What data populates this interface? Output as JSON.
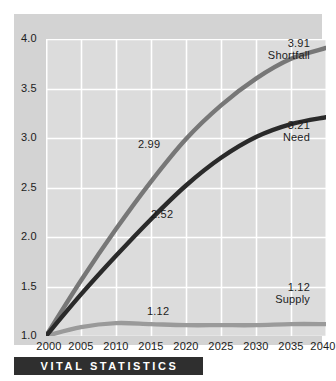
{
  "banner": {
    "title": "VITAL STATISTICS",
    "background": "#2f2f2f",
    "text_color": "#ffffff"
  },
  "colors": {
    "outer_panel": "#d3d3d3",
    "plot_background": "#dcdcdc",
    "gridline": "#ffffff",
    "shortfall": "#777777",
    "need": "#2a2a2a",
    "supply": "#9a9a9a",
    "text": "#1c1c1c"
  },
  "chart_data": {
    "type": "line",
    "title": "VITAL STATISTICS",
    "xlabel": "",
    "ylabel": "",
    "xlim": [
      2000,
      2040
    ],
    "ylim": [
      1.0,
      4.0
    ],
    "grid": true,
    "legend": "inline-end-labels",
    "x": [
      2000,
      2005,
      2010,
      2015,
      2020,
      2025,
      2030,
      2035,
      2040
    ],
    "xtick_labels": [
      "2000",
      "2005",
      "2010",
      "2015",
      "2020",
      "2025",
      "2030",
      "2035",
      "2040"
    ],
    "ytick_values": [
      1.0,
      1.5,
      2.0,
      2.5,
      3.0,
      3.5,
      4.0
    ],
    "ytick_labels": [
      "1.0",
      "1.5",
      "2.0",
      "2.5",
      "3.0",
      "3.5",
      "4.0"
    ],
    "series": [
      {
        "name": "Shortfall",
        "color": "#777777",
        "values": [
          1.0,
          1.56,
          2.08,
          2.56,
          2.99,
          3.33,
          3.6,
          3.8,
          3.91
        ],
        "end_label": "3.91",
        "inline_label": {
          "text": "2.99",
          "x": 2020,
          "y": 2.99
        }
      },
      {
        "name": "Need",
        "color": "#2a2a2a",
        "values": [
          1.0,
          1.42,
          1.81,
          2.18,
          2.52,
          2.8,
          3.01,
          3.14,
          3.21
        ],
        "end_label": "3.21",
        "inline_label": {
          "text": "2.52",
          "x": 2020,
          "y": 2.52
        }
      },
      {
        "name": "Supply",
        "color": "#9a9a9a",
        "values": [
          1.0,
          1.09,
          1.13,
          1.12,
          1.11,
          1.11,
          1.11,
          1.12,
          1.12
        ],
        "end_label": "1.12",
        "inline_label": {
          "text": "1.12",
          "x": 2020,
          "y": 1.11
        }
      }
    ]
  },
  "annotations": {
    "shortfall_end_value": "3.91",
    "shortfall_end_name": "Shortfall",
    "need_end_value": "3.21",
    "need_end_name": "Need",
    "supply_end_value": "1.12",
    "supply_end_name": "Supply",
    "shortfall_mid": "2.99",
    "need_mid": "2.52",
    "supply_mid": "1.12"
  }
}
